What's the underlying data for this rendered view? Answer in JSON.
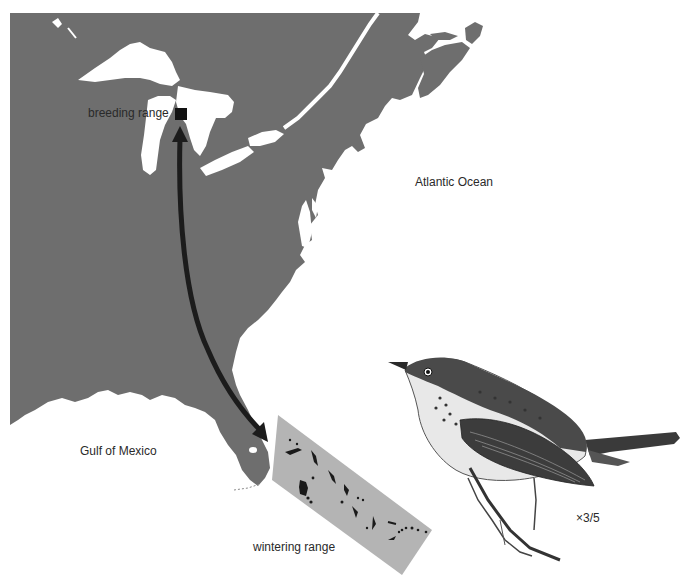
{
  "map": {
    "land_color": "#6e6e6e",
    "water_color": "#ffffff",
    "inset_color": "#b4b4b4",
    "range_color": "#1a1a1a",
    "arrow_color": "#1c1c1c"
  },
  "labels": {
    "breeding_range": "breeding range",
    "atlantic_ocean": "Atlantic Ocean",
    "gulf_of_mexico": "Gulf of Mexico",
    "wintering_range": "wintering range",
    "scale": "×3/5"
  },
  "legend": {
    "breeding_marker": "black-square",
    "migration_arrow": "double-headed-curved-arrow"
  },
  "illustration": {
    "subject": "warbler-bird"
  }
}
